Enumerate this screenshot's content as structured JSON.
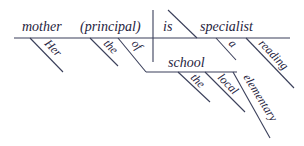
{
  "diagram": {
    "type": "sentence-diagram",
    "sentence": "Her mother (principal) is a reading specialist of the local elementary school",
    "baseline": {
      "subject": "mother",
      "appositive": "(principal)",
      "verb": "is",
      "predicate_nominative": "specialist"
    },
    "subject_modifiers": [
      "Her",
      "the"
    ],
    "preposition": "of",
    "object_of_preposition": "school",
    "object_modifiers": [
      "the",
      "local",
      "elementary"
    ],
    "predicate_modifiers": [
      "a",
      "reading"
    ]
  }
}
